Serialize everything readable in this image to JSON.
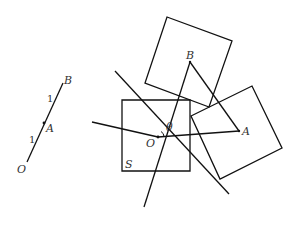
{
  "left_figure": {
    "points": {
      "O": {
        "label": "O",
        "x": 27,
        "y": 162
      },
      "A": {
        "label": "A",
        "x": 44,
        "y": 123
      },
      "B": {
        "label": "B",
        "x": 63,
        "y": 83
      }
    },
    "segment_labels": {
      "OA": "1",
      "AB": "1"
    }
  },
  "right_figure": {
    "square_S": {
      "label": "S",
      "corners": [
        [
          122,
          100
        ],
        [
          190,
          100
        ],
        [
          190,
          171
        ],
        [
          122,
          171
        ]
      ]
    },
    "square_top": {
      "corners": [
        [
          167,
          17
        ],
        [
          232,
          41
        ],
        [
          209,
          107
        ],
        [
          145,
          83
        ]
      ]
    },
    "square_right": {
      "corners": [
        [
          191,
          116
        ],
        [
          252,
          86
        ],
        [
          282,
          148
        ],
        [
          220,
          179
        ]
      ]
    },
    "point_O": {
      "label": "O",
      "x": 158,
      "y": 137
    },
    "point_A": {
      "label": "A",
      "x": 239,
      "y": 131
    },
    "point_B": {
      "label": "B",
      "x": 190,
      "y": 62
    },
    "angle_label": "θ",
    "lines": [
      {
        "from": [
          115,
          71
        ],
        "to": [
          229,
          194
        ]
      },
      {
        "from": [
          92,
          122
        ],
        "to": [
          239,
          131
        ]
      },
      {
        "from": [
          144,
          207
        ],
        "to": [
          190,
          62
        ]
      }
    ]
  }
}
